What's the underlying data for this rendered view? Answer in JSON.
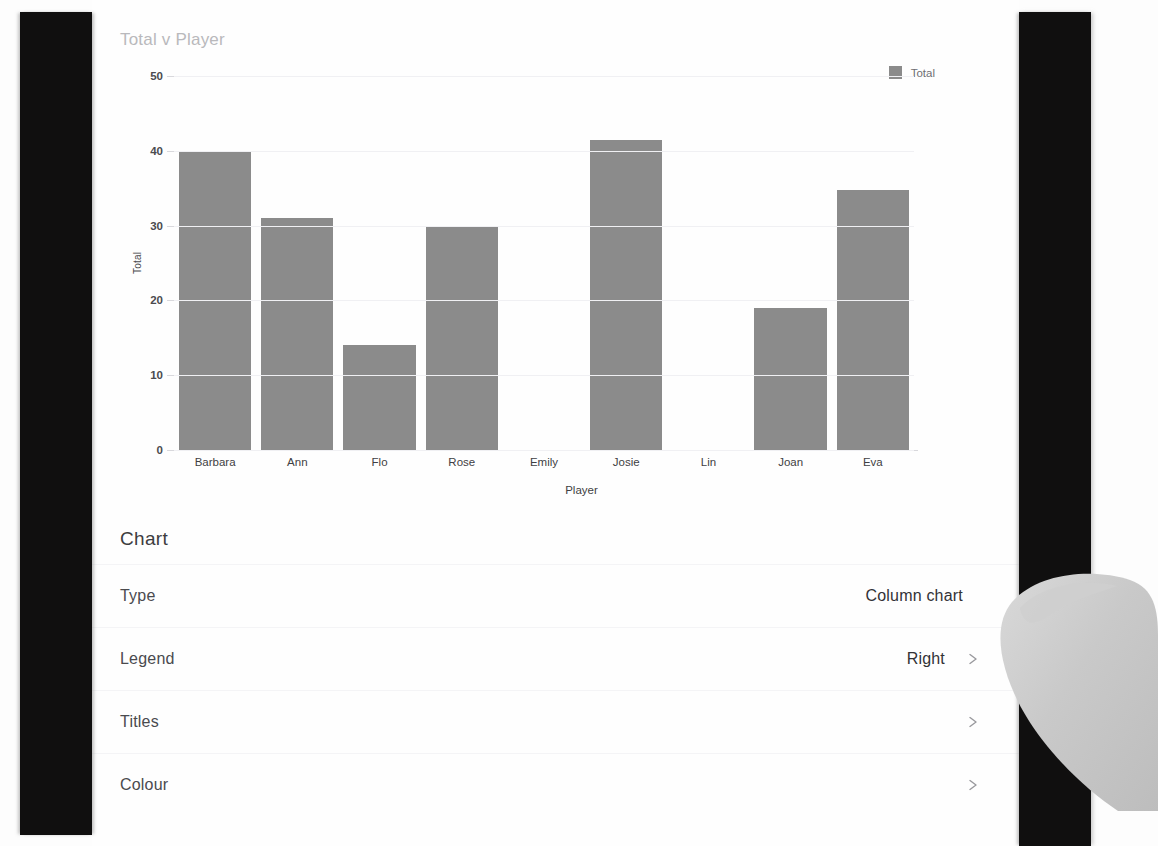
{
  "chart_data": {
    "type": "bar",
    "title": "Total v Player",
    "xlabel": "Player",
    "ylabel": "Total",
    "categories": [
      "Barbara",
      "Ann",
      "Flo",
      "Rose",
      "Emily",
      "Josie",
      "Lin",
      "Joan",
      "Eva"
    ],
    "values": [
      40,
      31,
      14,
      30,
      0,
      41.5,
      0,
      19,
      34.7
    ],
    "series": [
      {
        "name": "Total",
        "values": [
          40,
          31,
          14,
          30,
          0,
          41.5,
          0,
          19,
          34.7
        ]
      }
    ],
    "ylim": [
      0,
      50
    ],
    "yticks": [
      0,
      10,
      20,
      30,
      40,
      50
    ],
    "grid": true,
    "legend_position": "right",
    "bar_color": "#8b8b8b"
  },
  "legend": {
    "entries": [
      {
        "label": "Total",
        "color": "#8b8b8b"
      }
    ]
  },
  "settings": {
    "header": "Chart",
    "rows": [
      {
        "label": "Type",
        "value": "Column chart",
        "chevron": false
      },
      {
        "label": "Legend",
        "value": "Right",
        "chevron": true
      },
      {
        "label": "Titles",
        "value": "",
        "chevron": true
      },
      {
        "label": "Colour",
        "value": "",
        "chevron": true
      }
    ]
  },
  "colors": {
    "bar": "#8b8b8b",
    "title_text": "#b9b9bc",
    "body_text": "#4a4a4e",
    "band": "#100f0f",
    "gridline": "#f0f0f3"
  }
}
